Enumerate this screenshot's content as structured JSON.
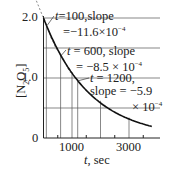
{
  "chart_data": {
    "type": "line",
    "title": "",
    "xlabel": "t, sec",
    "ylabel": "[N2O5]",
    "xlim": [
      0,
      4000
    ],
    "ylim": [
      0,
      2.0
    ],
    "x_ticks": [
      {
        "value": 1000,
        "label": "1000"
      },
      {
        "value": 3000,
        "label": "3000"
      }
    ],
    "y_ticks": [
      {
        "value": 0,
        "label": "0"
      },
      {
        "value": 1.0,
        "label": "1.0"
      },
      {
        "value": 2.0,
        "label": "2.0"
      }
    ],
    "grid": true,
    "vertical_gridlines": [
      100,
      600,
      1000,
      1200,
      2000,
      3000
    ],
    "horizontal_gridlines": [
      0.5,
      1.0,
      1.5,
      2.0
    ],
    "series": [
      {
        "name": "[N2O5] decay",
        "x": [
          0,
          100,
          250,
          500,
          600,
          750,
          1000,
          1200,
          1500,
          2000,
          2500,
          3000,
          3500,
          3800
        ],
        "y": [
          2.0,
          1.88,
          1.72,
          1.48,
          1.39,
          1.28,
          1.1,
          0.98,
          0.83,
          0.62,
          0.46,
          0.34,
          0.25,
          0.2
        ]
      }
    ],
    "tangents": [
      {
        "t": 100,
        "slope": -0.00116
      },
      {
        "t": 600,
        "slope": -0.00085
      },
      {
        "t": 1200,
        "slope": -0.00059
      }
    ],
    "annotations": [
      {
        "text": "t=100, slope = -11.6×10^-4",
        "at_t": 100
      },
      {
        "text": "t = 600, slope = -8.5 × 10^-4",
        "at_t": 600
      },
      {
        "text": "t = 1200, slope = -5.9 × 10^-4",
        "at_t": 1200
      }
    ]
  },
  "labels": {
    "ann1_line1_t": "t",
    "ann1_line1_rest": "=100,slope",
    "ann1_line2": "=−11.6×10",
    "ann2_line1_t": "t",
    "ann2_line1_rest": " = 600, slope",
    "ann2_line2": "= −8.5 × 10",
    "ann3_line1_t": "t",
    "ann3_line1_rest": " = 1200,",
    "ann3_line2": "slope = −5.9",
    "ann3_line3": "× 10",
    "exp": "−4",
    "y_tick_2": "2.0",
    "y_tick_1": "1.0",
    "y_tick_0": "0",
    "x_tick_1000": "1000",
    "x_tick_3000": "3000",
    "xlabel_t": "t",
    "xlabel_unit": ", sec",
    "ylabel_open": "[N",
    "ylabel_sub2": "2",
    "ylabel_O": "O",
    "ylabel_sub5": "5",
    "ylabel_close": "]"
  }
}
